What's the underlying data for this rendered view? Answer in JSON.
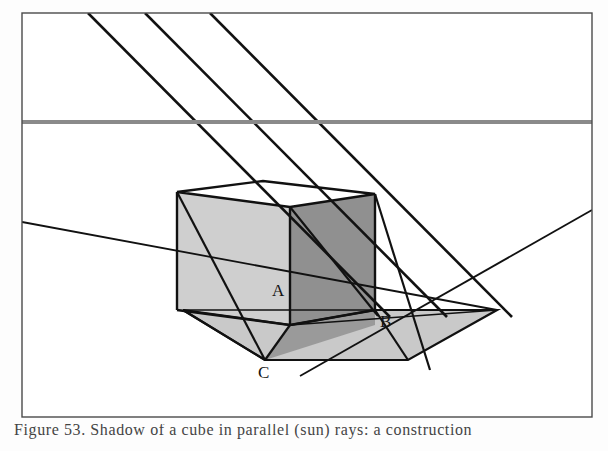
{
  "figure": {
    "background_color": "#fdfdfd",
    "frame": {
      "name": "figure-border",
      "stroke": "#4a4a4a",
      "stroke_width": 1.4,
      "x": 22,
      "y": 13,
      "width": 570,
      "height": 404
    },
    "horizon_line": {
      "label": "horizon",
      "color": "#8a8a8a",
      "stroke_width": 4,
      "y": 122,
      "x_start": 22,
      "x_end": 592
    },
    "light_rays": {
      "color": "#111111",
      "stroke_width": 2.6,
      "count": 3,
      "paths": [
        {
          "id": "ray-1",
          "x1": 88,
          "y1": 13,
          "x2": 390,
          "y2": 317
        },
        {
          "id": "ray-2",
          "x1": 145,
          "y1": 13,
          "x2": 447,
          "y2": 317
        },
        {
          "id": "ray-3",
          "x1": 210,
          "y1": 13,
          "x2": 512,
          "y2": 317
        }
      ]
    },
    "ground_lines": {
      "color": "#111111",
      "stroke_width": 1.8,
      "paths": [
        {
          "id": "ground-receding-left",
          "x1": 22,
          "y1": 222,
          "x2": 497,
          "y2": 310
        },
        {
          "id": "ground-receding-right",
          "x1": 592,
          "y1": 210,
          "x2": 300,
          "y2": 376
        }
      ]
    },
    "cube": {
      "name": "cube",
      "faces": [
        {
          "id": "cube-top-face",
          "tone": "#ffffff",
          "points": "177,192 263,181 375,194 290,207"
        },
        {
          "id": "cube-left-face",
          "tone": "#cfcfcf",
          "points": "177,192 290,207 290,325 177,310"
        },
        {
          "id": "cube-right-face",
          "tone": "#909090",
          "points": "290,207 375,194 375,310 290,325"
        }
      ],
      "edge_color": "#111111",
      "edge_width": 2.4
    },
    "shadow": {
      "name": "cast-shadow",
      "tone": "#c9c9c9",
      "outline_color": "#111111",
      "outline_width": 2.2,
      "points": "183,310 290,325 375,310 497,310 408,360 265,360"
    },
    "shadow_dark": {
      "name": "shadow-core",
      "tone": "#9a9a9a",
      "points": "290,325 375,310 375,325 265,360"
    },
    "labels": [
      {
        "id": "label-A",
        "text": "A",
        "x": 272,
        "y": 296
      },
      {
        "id": "label-B",
        "text": "B",
        "x": 380,
        "y": 327
      },
      {
        "id": "label-C",
        "text": "C",
        "x": 258,
        "y": 378
      }
    ]
  },
  "caption": {
    "text": "Figure 53. Shadow of a cube in parallel (sun) rays: a construction",
    "visible_note": "partially cropped at bottom edge"
  }
}
